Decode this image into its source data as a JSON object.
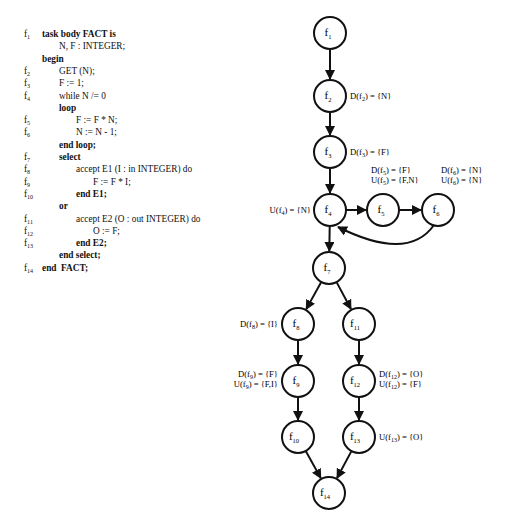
{
  "code": {
    "lines": [
      {
        "label": "f",
        "sub": "1",
        "indent": 0,
        "text": "task body FACT is",
        "bold": true
      },
      {
        "label": "",
        "sub": "",
        "indent": 2,
        "text": "N, F : INTEGER;",
        "bold": false
      },
      {
        "label": "",
        "sub": "",
        "indent": 0,
        "text": "begin",
        "bold": true
      },
      {
        "label": "f",
        "sub": "2",
        "indent": 2,
        "text": "GET (N);",
        "bold": false
      },
      {
        "label": "f",
        "sub": "3",
        "indent": 2,
        "text": "F := 1;",
        "bold": false
      },
      {
        "label": "f",
        "sub": "4",
        "indent": 2,
        "text": "while N /= 0",
        "bold": false
      },
      {
        "label": "",
        "sub": "",
        "indent": 2,
        "text": "loop",
        "bold": true
      },
      {
        "label": "f",
        "sub": "5",
        "indent": 4,
        "text": "F := F * N;",
        "bold": false
      },
      {
        "label": "f",
        "sub": "6",
        "indent": 4,
        "text": "N := N - 1;",
        "bold": false
      },
      {
        "label": "",
        "sub": "",
        "indent": 2,
        "text": "end loop;",
        "bold": true
      },
      {
        "label": "f",
        "sub": "7",
        "indent": 2,
        "text": "select",
        "bold": true
      },
      {
        "label": "f",
        "sub": "8",
        "indent": 4,
        "text": "accept E1 (I : in INTEGER) do",
        "bold": false
      },
      {
        "label": "f",
        "sub": "9",
        "indent": 6,
        "text": "F := F * I;",
        "bold": false
      },
      {
        "label": "f",
        "sub": "10",
        "indent": 4,
        "text": "end E1;",
        "bold": true
      },
      {
        "label": "",
        "sub": "",
        "indent": 2,
        "text": "or",
        "bold": true
      },
      {
        "label": "f",
        "sub": "11",
        "indent": 4,
        "text": "accept E2 (O : out INTEGER) do",
        "bold": false
      },
      {
        "label": "f",
        "sub": "12",
        "indent": 6,
        "text": "O := F;",
        "bold": false
      },
      {
        "label": "f",
        "sub": "13",
        "indent": 4,
        "text": "end E2;",
        "bold": true
      },
      {
        "label": "",
        "sub": "",
        "indent": 2,
        "text": "end select;",
        "bold": true
      },
      {
        "label": "f",
        "sub": "14",
        "indent": 0,
        "text": "end  FACT;",
        "bold": true
      }
    ]
  },
  "graph": {
    "nodes": [
      {
        "id": "f1",
        "base": "f",
        "sub": "1",
        "x": 330,
        "y": 33
      },
      {
        "id": "f2",
        "base": "f",
        "sub": "2",
        "x": 330,
        "y": 96
      },
      {
        "id": "f3",
        "base": "f",
        "sub": "3",
        "x": 330,
        "y": 152
      },
      {
        "id": "f4",
        "base": "f",
        "sub": "4",
        "x": 330,
        "y": 210
      },
      {
        "id": "f5",
        "base": "f",
        "sub": "5",
        "x": 383,
        "y": 210
      },
      {
        "id": "f6",
        "base": "f",
        "sub": "6",
        "x": 438,
        "y": 210
      },
      {
        "id": "f7",
        "base": "f",
        "sub": "7",
        "x": 329,
        "y": 268
      },
      {
        "id": "f8",
        "base": "f",
        "sub": "8",
        "x": 298,
        "y": 324
      },
      {
        "id": "f11",
        "base": "f",
        "sub": "11",
        "x": 359,
        "y": 324
      },
      {
        "id": "f9",
        "base": "f",
        "sub": "9",
        "x": 298,
        "y": 381
      },
      {
        "id": "f12",
        "base": "f",
        "sub": "12",
        "x": 359,
        "y": 381
      },
      {
        "id": "f10",
        "base": "f",
        "sub": "10",
        "x": 298,
        "y": 437
      },
      {
        "id": "f13",
        "base": "f",
        "sub": "13",
        "x": 359,
        "y": 437
      },
      {
        "id": "f14",
        "base": "f",
        "sub": "14",
        "x": 329,
        "y": 493
      }
    ],
    "edges": [
      {
        "from": "f1",
        "to": "f2"
      },
      {
        "from": "f2",
        "to": "f3"
      },
      {
        "from": "f3",
        "to": "f4"
      },
      {
        "from": "f4",
        "to": "f5"
      },
      {
        "from": "f5",
        "to": "f6"
      },
      {
        "from": "f6",
        "to": "f4",
        "curved": true
      },
      {
        "from": "f4",
        "to": "f7"
      },
      {
        "from": "f7",
        "to": "f8"
      },
      {
        "from": "f7",
        "to": "f11"
      },
      {
        "from": "f8",
        "to": "f9"
      },
      {
        "from": "f11",
        "to": "f12"
      },
      {
        "from": "f9",
        "to": "f10"
      },
      {
        "from": "f12",
        "to": "f13"
      },
      {
        "from": "f10",
        "to": "f14"
      },
      {
        "from": "f13",
        "to": "f14"
      }
    ],
    "annotations": [
      {
        "node": "f2",
        "lines": [
          [
            "D(f",
            "2",
            ") = {N}"
          ]
        ],
        "x": 350,
        "y": 99,
        "anchor": "start"
      },
      {
        "node": "f3",
        "lines": [
          [
            "D(f",
            "3",
            ") = {F}"
          ]
        ],
        "x": 350,
        "y": 155,
        "anchor": "start"
      },
      {
        "node": "f4",
        "lines": [
          [
            "U(f",
            "4",
            ") = {N}"
          ]
        ],
        "x": 311,
        "y": 213,
        "anchor": "end"
      },
      {
        "node": "f5",
        "lines": [
          [
            "D(f",
            "5",
            ") = {F}"
          ],
          [
            "U(f",
            "5",
            ") = {F,N}"
          ]
        ],
        "x": 371,
        "y": 173,
        "anchor": "start"
      },
      {
        "node": "f6",
        "lines": [
          [
            "D(f",
            "6",
            ") = {N}"
          ],
          [
            "U(f",
            "6",
            ") = {N}"
          ]
        ],
        "x": 441,
        "y": 173,
        "anchor": "start"
      },
      {
        "node": "f8",
        "lines": [
          [
            "D(f",
            "8",
            ") = {I}"
          ]
        ],
        "x": 278,
        "y": 327,
        "anchor": "end"
      },
      {
        "node": "f9",
        "lines": [
          [
            "D(f",
            "9",
            ") = {F}"
          ],
          [
            "U(f",
            "9",
            ") = {F,I}"
          ]
        ],
        "x": 278,
        "y": 377,
        "anchor": "end"
      },
      {
        "node": "f12",
        "lines": [
          [
            "D(f",
            "12",
            ") = {O}"
          ],
          [
            "U(f",
            "12",
            ") = {F}"
          ]
        ],
        "x": 379,
        "y": 377,
        "anchor": "start"
      },
      {
        "node": "f13",
        "lines": [
          [
            "U(f",
            "13",
            ") = {O}"
          ]
        ],
        "x": 379,
        "y": 440,
        "anchor": "start"
      }
    ]
  }
}
